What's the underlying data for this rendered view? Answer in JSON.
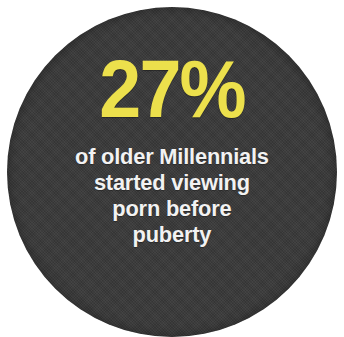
{
  "card": {
    "shape": "circle",
    "background_color": "#3b3b3b",
    "accent_color": "#ece04c",
    "text_color": "#f2f2f2",
    "page_background_color": "#ffffff"
  },
  "stat": {
    "value": "27",
    "unit": "%",
    "figure": "27%",
    "numeric_value": 27
  },
  "description": {
    "full_text": "of older Millennials started viewing porn before puberty",
    "lines": [
      "of older Millennials",
      "started viewing",
      "porn before",
      "puberty"
    ]
  }
}
